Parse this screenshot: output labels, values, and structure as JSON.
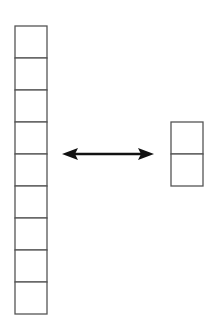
{
  "diagram": {
    "colors": {
      "stroke": "#555555",
      "arrow": "#111111",
      "background": "#ffffff"
    },
    "left_stack": {
      "cells": 9,
      "x": 15,
      "y": 26,
      "width": 32,
      "cell_height": 32
    },
    "right_stack": {
      "cells": 2,
      "x": 171,
      "y": 122,
      "width": 32,
      "cell_height": 32
    },
    "arrow": {
      "type": "double-headed",
      "x1": 62,
      "x2": 154,
      "y": 154
    }
  }
}
